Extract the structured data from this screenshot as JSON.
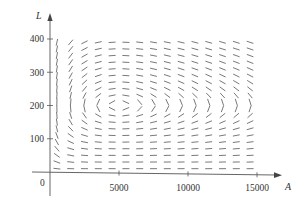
{
  "chart_data": {
    "type": "direction-field",
    "title": "",
    "xlabel": "A",
    "ylabel": "L",
    "origin_label": "0",
    "xlim": [
      0,
      16500
    ],
    "ylim": [
      0,
      420
    ],
    "x_ticks": [
      5000,
      10000,
      15000
    ],
    "x_tick_labels": [
      "5000",
      "10000",
      "15000"
    ],
    "y_ticks": [
      100,
      200,
      300,
      400
    ],
    "y_tick_labels": [
      "100",
      "200",
      "300",
      "400"
    ],
    "grid": false,
    "legend": null,
    "model": {
      "dA_dt": "2A - 0.01AL",
      "dL_dt": "-0.5L + 0.0001AL",
      "equilibrium": [
        5000,
        200
      ]
    },
    "field_grid": {
      "A_start": 500,
      "A_step": 1000,
      "A_count": 15,
      "L_start": 10,
      "L_step": 20,
      "L_count": 20
    },
    "colors": {
      "axis": "#555555",
      "segments": "#555555",
      "text": "#333333"
    }
  }
}
